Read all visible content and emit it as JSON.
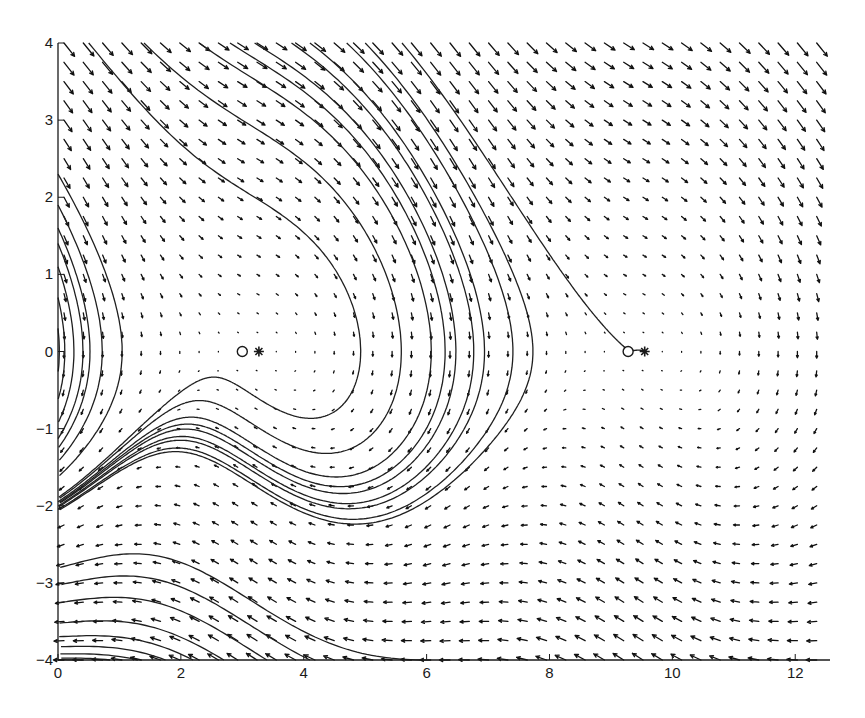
{
  "chart_data": {
    "type": "phase_portrait",
    "title": "",
    "xlabel": "",
    "ylabel": "",
    "xlim": [
      0,
      12.566
    ],
    "ylim": [
      -4,
      4
    ],
    "grid": false,
    "legend": null,
    "x_ticks": [
      0,
      2,
      4,
      6,
      8,
      10,
      12
    ],
    "x_tick_labels": [
      "0",
      "2",
      "4",
      "6",
      "8",
      "10",
      "12"
    ],
    "y_ticks": [
      -4,
      -3,
      -2,
      -1,
      0,
      1,
      2,
      3,
      4
    ],
    "y_tick_labels": [
      "−4",
      "−3",
      "−2",
      "−1",
      "0",
      "1",
      "2",
      "3",
      "4"
    ],
    "vector_field": {
      "description": "quiver plot of direction field",
      "nx": 40,
      "ny": 33,
      "equation": "x' = y, y' = -0.5*y + cos(x - 3.135) - 0.991"
    },
    "equilibria": [
      {
        "marker": "o",
        "x": 3.0,
        "y": 0,
        "label": "circle-marker"
      },
      {
        "marker": "*",
        "x": 3.27,
        "y": 0,
        "label": "star-marker"
      },
      {
        "marker": "o",
        "x": 9.28,
        "y": 0,
        "label": "circle-marker"
      },
      {
        "marker": "*",
        "x": 9.55,
        "y": 0,
        "label": "star-marker"
      }
    ],
    "trajectories": {
      "description": "solution curves converging toward equilibrium points and wrapping between them",
      "count_approx": 30
    }
  },
  "colors": {
    "background": "#ffffff",
    "axis": "#1a1a1a",
    "arrows": "#111111",
    "curves": "#1f1f1f"
  }
}
